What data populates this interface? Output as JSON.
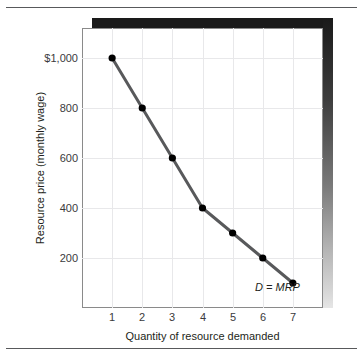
{
  "chart_data": {
    "type": "line",
    "title": "",
    "subtitle": "",
    "xlabel": "Quantity of resource demanded",
    "ylabel": "Resource price (monthly wage)",
    "x": [
      1,
      2,
      3,
      4,
      5,
      6,
      7
    ],
    "values": [
      1000,
      800,
      600,
      400,
      300,
      200,
      100
    ],
    "series": [
      {
        "name": "D = MRP",
        "x": [
          1,
          2,
          3,
          4,
          5,
          6,
          7
        ],
        "values": [
          1000,
          800,
          600,
          400,
          300,
          200,
          100
        ]
      }
    ],
    "xticklabels": [
      "1",
      "2",
      "3",
      "4",
      "5",
      "6",
      "7"
    ],
    "yticklabels": [
      "$1,000",
      "800",
      "600",
      "400",
      "200"
    ],
    "ytickvalues": [
      1000,
      800,
      600,
      400,
      200
    ],
    "xlim": [
      0,
      8
    ],
    "ylim": [
      0,
      1120
    ],
    "grid": true,
    "legend": "none",
    "annotations": [
      {
        "text": "D = MRP",
        "x": 6.6,
        "y": 60,
        "style": "italic"
      }
    ],
    "marker": "filled-circle",
    "colors": {
      "line": "#58595b",
      "marker": "#000000",
      "grid": "#e8e8ea",
      "axis": "#8a8a8a",
      "text": "#231f20",
      "shadow": "#1a1a1a",
      "rule": "#58595b",
      "background": "#ffffff"
    }
  },
  "axis": {
    "y_title": "Resource price (monthly wage)",
    "x_title": "Quantity of resource demanded",
    "y_ticks": [
      "$1,000",
      "800",
      "600",
      "400",
      "200"
    ],
    "x_ticks": [
      "1",
      "2",
      "3",
      "4",
      "5",
      "6",
      "7"
    ]
  },
  "curve": {
    "label": "D = MRP"
  }
}
